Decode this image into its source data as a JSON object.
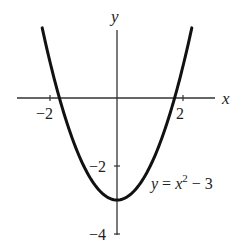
{
  "chart_data": {
    "type": "line",
    "title": "",
    "function": "y = x^2 - 3",
    "xlabel": "x",
    "ylabel": "y",
    "xlim": [
      -3.0,
      3.0
    ],
    "ylim": [
      -4,
      2.5
    ],
    "x_ticks": [
      {
        "value": -2,
        "label": "−2"
      },
      {
        "value": 2,
        "label": "2"
      }
    ],
    "y_ticks": [
      {
        "value": -2,
        "label": "−2"
      },
      {
        "value": -4,
        "label": "−4"
      }
    ],
    "grid": false,
    "series": [
      {
        "name": "y = x² − 3",
        "x": [
          -2.25,
          -2,
          -1.732,
          -1.5,
          -1,
          -0.5,
          0,
          0.5,
          1,
          1.5,
          1.732,
          2,
          2.25
        ],
        "y": [
          2.06,
          1,
          0,
          -0.75,
          -2,
          -2.75,
          -3,
          -2.75,
          -2,
          -0.75,
          0,
          1,
          2.06
        ]
      }
    ],
    "annotations": [
      {
        "text": "y = x² − 3",
        "x": 1.4,
        "y": -2.7
      }
    ]
  },
  "labels": {
    "x_axis": "x",
    "y_axis": "y",
    "tick_x_neg2": "−2",
    "tick_x_2": "2",
    "tick_y_neg2": "−2",
    "tick_y_neg4": "−4",
    "eq_y": "y",
    "eq_eq": " = ",
    "eq_x": "x",
    "eq_exp": "2",
    "eq_rest": " − 3"
  },
  "colors": {
    "curve": "#111111",
    "axis": "#333333",
    "text": "#222222"
  }
}
